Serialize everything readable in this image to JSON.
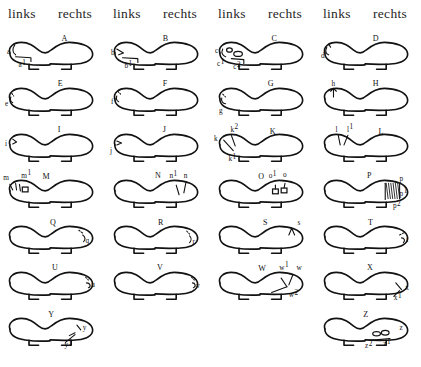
{
  "header": {
    "columns": [
      {
        "label": "links",
        "x": 8
      },
      {
        "label": "rechts",
        "x": 58
      },
      {
        "label": "links",
        "x": 113
      },
      {
        "label": "rechts",
        "x": 163
      },
      {
        "label": "links",
        "x": 218
      },
      {
        "label": "rechts",
        "x": 268
      },
      {
        "label": "links",
        "x": 323
      },
      {
        "label": "rechts",
        "x": 373
      }
    ]
  },
  "figures": [
    {
      "caption": "A",
      "caption_x": 62,
      "caption_y": 14,
      "col": 0,
      "row": 0,
      "labels": [
        {
          "text": "a",
          "sup": "",
          "x": 5,
          "y": 27
        },
        {
          "text": "a",
          "sup": "1",
          "x": 17,
          "y": 41
        }
      ]
    },
    {
      "caption": "B",
      "caption_x": 58,
      "caption_y": 14,
      "col": 1,
      "row": 0,
      "labels": [
        {
          "text": "b",
          "sup": "",
          "x": 4,
          "y": 28
        },
        {
          "text": "b",
          "sup": "1",
          "x": 18,
          "y": 42
        }
      ]
    },
    {
      "caption": "C",
      "caption_x": 62,
      "caption_y": 14,
      "col": 2,
      "row": 0,
      "labels": [
        {
          "text": "c",
          "sup": "",
          "x": 3,
          "y": 26
        },
        {
          "text": "c",
          "sup": "1",
          "x": 5,
          "y": 40
        },
        {
          "text": "c",
          "sup": "2",
          "x": 22,
          "y": 43
        }
      ]
    },
    {
      "caption": "D",
      "caption_x": 58,
      "caption_y": 14,
      "col": 3,
      "row": 0,
      "labels": [
        {
          "text": "d",
          "sup": "",
          "x": 4,
          "y": 31
        }
      ]
    },
    {
      "caption": "E",
      "caption_x": 58,
      "caption_y": 13,
      "col": 0,
      "row": 1,
      "labels": [
        {
          "text": "e",
          "sup": "",
          "x": 3,
          "y": 33
        }
      ]
    },
    {
      "caption": "F",
      "caption_x": 58,
      "caption_y": 13,
      "col": 1,
      "row": 1,
      "labels": [
        {
          "text": "f",
          "sup": "",
          "x": 4,
          "y": 31
        }
      ]
    },
    {
      "caption": "G",
      "caption_x": 58,
      "caption_y": 13,
      "col": 2,
      "row": 1,
      "labels": [
        {
          "text": "g",
          "sup": "",
          "x": 7,
          "y": 41
        }
      ]
    },
    {
      "caption": "H",
      "caption_x": 58,
      "caption_y": 13,
      "col": 3,
      "row": 1,
      "labels": [
        {
          "text": "h",
          "sup": "",
          "x": 15,
          "y": 12
        }
      ]
    },
    {
      "caption": "I",
      "caption_x": 58,
      "caption_y": 13,
      "col": 0,
      "row": 2,
      "labels": [
        {
          "text": "i",
          "sup": "",
          "x": 3,
          "y": 27
        }
      ]
    },
    {
      "caption": "J",
      "caption_x": 58,
      "caption_y": 13,
      "col": 1,
      "row": 2,
      "labels": [
        {
          "text": "j",
          "sup": "",
          "x": 3,
          "y": 34
        }
      ]
    },
    {
      "caption": "K",
      "caption_x": 60,
      "caption_y": 15,
      "col": 2,
      "row": 2,
      "labels": [
        {
          "text": "k",
          "sup": "",
          "x": 2,
          "y": 22
        },
        {
          "text": "k",
          "sup": "2",
          "x": 19,
          "y": 12
        },
        {
          "text": "k",
          "sup": "1",
          "x": 17,
          "y": 43
        }
      ]
    },
    {
      "caption": "L",
      "caption_x": 64,
      "caption_y": 15,
      "col": 3,
      "row": 2,
      "labels": [
        {
          "text": "l",
          "sup": "",
          "x": 19,
          "y": 12
        },
        {
          "text": "l",
          "sup": "1",
          "x": 31,
          "y": 12
        }
      ]
    },
    {
      "caption": "M",
      "caption_x": 42,
      "caption_y": 14,
      "col": 0,
      "row": 3,
      "labels": [
        {
          "text": "m",
          "sup": "",
          "x": 1,
          "y": 15
        },
        {
          "text": "m",
          "sup": "1",
          "x": 20,
          "y": 12
        }
      ]
    },
    {
      "caption": "N",
      "caption_x": 50,
      "caption_y": 13,
      "col": 1,
      "row": 3,
      "labels": [
        {
          "text": "n",
          "sup": "1",
          "x": 65,
          "y": 13
        },
        {
          "text": "n",
          "sup": "",
          "x": 80,
          "y": 12
        }
      ]
    },
    {
      "caption": "O",
      "caption_x": 48,
      "caption_y": 14,
      "col": 2,
      "row": 3,
      "labels": [
        {
          "text": "o",
          "sup": "1",
          "x": 59,
          "y": 13
        },
        {
          "text": "o",
          "sup": "",
          "x": 74,
          "y": 11
        }
      ]
    },
    {
      "caption": "P",
      "caption_x": 52,
      "caption_y": 13,
      "col": 3,
      "row": 3,
      "labels": [
        {
          "text": "p",
          "sup": "",
          "x": 86,
          "y": 16
        },
        {
          "text": "p",
          "sup": "1",
          "x": 86,
          "y": 31
        },
        {
          "text": "p",
          "sup": "2",
          "x": 79,
          "y": 44
        }
      ]
    },
    {
      "caption": "Q",
      "caption_x": 50,
      "caption_y": 14,
      "col": 0,
      "row": 4,
      "labels": [
        {
          "text": "q",
          "sup": "",
          "x": 87,
          "y": 32
        }
      ]
    },
    {
      "caption": "R",
      "caption_x": 53,
      "caption_y": 14,
      "col": 1,
      "row": 4,
      "labels": [
        {
          "text": "r",
          "sup": "",
          "x": 89,
          "y": 33
        }
      ]
    },
    {
      "caption": "S",
      "caption_x": 53,
      "caption_y": 14,
      "col": 2,
      "row": 4,
      "labels": [
        {
          "text": "s",
          "sup": "",
          "x": 89,
          "y": 14
        }
      ]
    },
    {
      "caption": "T",
      "caption_x": 53,
      "caption_y": 14,
      "col": 3,
      "row": 4,
      "labels": [
        {
          "text": "t",
          "sup": "",
          "x": 93,
          "y": 31
        }
      ]
    },
    {
      "caption": "U",
      "caption_x": 52,
      "caption_y": 13,
      "col": 0,
      "row": 5,
      "labels": [
        {
          "text": "u",
          "sup": "",
          "x": 93,
          "y": 30
        }
      ]
    },
    {
      "caption": "V",
      "caption_x": 52,
      "caption_y": 13,
      "col": 1,
      "row": 5,
      "labels": [
        {
          "text": "v",
          "sup": "",
          "x": 93,
          "y": 31
        }
      ]
    },
    {
      "caption": "W",
      "caption_x": 48,
      "caption_y": 14,
      "col": 2,
      "row": 5,
      "labels": [
        {
          "text": "w",
          "sup": "1",
          "x": 70,
          "y": 12
        },
        {
          "text": "w",
          "sup": "",
          "x": 88,
          "y": 13
        },
        {
          "text": "w",
          "sup": "2",
          "x": 80,
          "y": 41
        }
      ]
    },
    {
      "caption": "X",
      "caption_x": 52,
      "caption_y": 13,
      "col": 3,
      "row": 5,
      "labels": [
        {
          "text": "x",
          "sup": "",
          "x": 92,
          "y": 33
        },
        {
          "text": "x",
          "sup": "1",
          "x": 80,
          "y": 44
        }
      ]
    },
    {
      "caption": "Y",
      "caption_x": 48,
      "caption_y": 14,
      "col": 0,
      "row": 6,
      "labels": [
        {
          "text": "y",
          "sup": "",
          "x": 84,
          "y": 27
        },
        {
          "text": "y",
          "sup": "1",
          "x": 65,
          "y": 45
        }
      ]
    },
    {
      "caption": "Z",
      "caption_x": 48,
      "caption_y": 14,
      "col": 3,
      "row": 6,
      "labels": [
        {
          "text": "z",
          "sup": "",
          "x": 86,
          "y": 27
        },
        {
          "text": "z",
          "sup": "1",
          "x": 69,
          "y": 44
        },
        {
          "text": "z",
          "sup": "2",
          "x": 50,
          "y": 46
        }
      ]
    }
  ],
  "layout": {
    "col_x": [
      0,
      105,
      210,
      315
    ],
    "row_y": [
      0,
      46,
      92,
      138,
      184,
      230,
      276
    ]
  },
  "colors": {
    "ink": "#121212",
    "background": "#ffffff",
    "header_text": "#262626"
  }
}
